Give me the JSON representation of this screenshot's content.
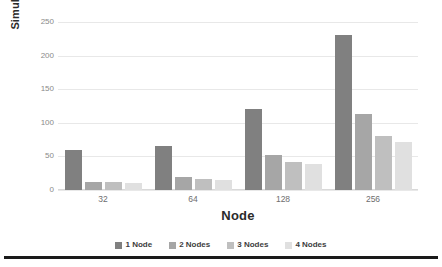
{
  "chart_data": {
    "type": "bar",
    "title": "",
    "xlabel": "Node",
    "ylabel": "Simulation Time (s)",
    "categories": [
      "32",
      "64",
      "128",
      "256"
    ],
    "series": [
      {
        "name": "1 Node",
        "color": "#808080",
        "values": [
          60,
          66,
          121,
          230
        ]
      },
      {
        "name": "2 Nodes",
        "color": "#a6a6a6",
        "values": [
          12,
          20,
          52,
          113
        ]
      },
      {
        "name": "3 Nodes",
        "color": "#bfbfbf",
        "values": [
          12,
          16,
          42,
          80
        ]
      },
      {
        "name": "4 Nodes",
        "color": "#e0e0e0",
        "values": [
          11,
          15,
          38,
          72
        ]
      }
    ],
    "ylim": [
      0,
      250
    ],
    "yticks": [
      0,
      50,
      100,
      150,
      200,
      250
    ],
    "ytick_labels": [
      "0",
      "50",
      "100",
      "150",
      "200",
      "250"
    ],
    "grid": true,
    "legend_position": "bottom"
  },
  "axes": {
    "y_title": "Simulation Time (s)",
    "x_title": "Node"
  },
  "legend": {
    "items": [
      {
        "label": "1 Node",
        "color": "#808080"
      },
      {
        "label": "2 Nodes",
        "color": "#a6a6a6"
      },
      {
        "label": "3 Nodes",
        "color": "#bfbfbf"
      },
      {
        "label": "4 Nodes",
        "color": "#e0e0e0"
      }
    ]
  }
}
